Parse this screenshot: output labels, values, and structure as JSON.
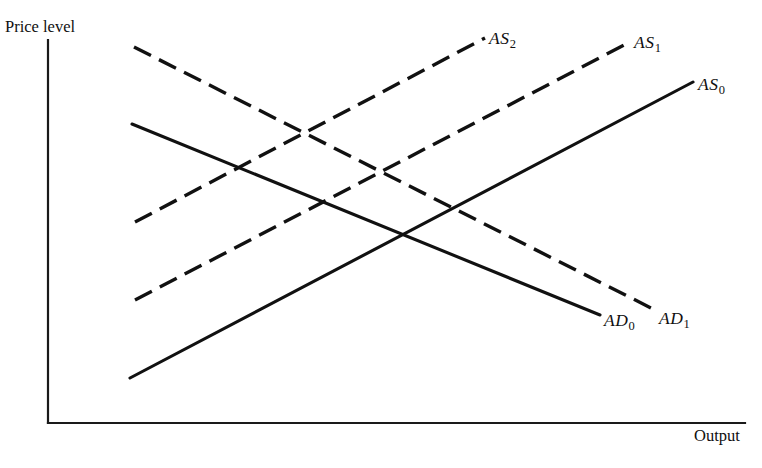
{
  "figure": {
    "type": "economics-as-ad-diagram",
    "background_color": "#ffffff",
    "line_color": "#111111"
  },
  "axes": {
    "y_label": "Price level",
    "x_label": "Output",
    "origin": {
      "x": 48,
      "y": 423
    },
    "y_axis_top": {
      "x": 48,
      "y": 40
    },
    "x_axis_right": {
      "x": 745,
      "y": 423
    }
  },
  "curves": [
    {
      "id": "AS0",
      "name_prefix": "AS",
      "subscript": "0",
      "style": "solid",
      "slope": "upward",
      "start": {
        "x": 130,
        "y": 378
      },
      "end": {
        "x": 693,
        "y": 82
      },
      "label_position": {
        "x": 698,
        "y": 74
      }
    },
    {
      "id": "AS1",
      "name_prefix": "AS",
      "subscript": "1",
      "style": "dashed",
      "slope": "upward",
      "start": {
        "x": 135,
        "y": 300
      },
      "end": {
        "x": 630,
        "y": 42
      },
      "label_position": {
        "x": 634,
        "y": 32
      }
    },
    {
      "id": "AS2",
      "name_prefix": "AS",
      "subscript": "2",
      "style": "dashed",
      "slope": "upward",
      "start": {
        "x": 135,
        "y": 222
      },
      "end": {
        "x": 485,
        "y": 38
      },
      "label_position": {
        "x": 489,
        "y": 28
      }
    },
    {
      "id": "AD0",
      "name_prefix": "AD",
      "subscript": "0",
      "style": "solid",
      "slope": "downward",
      "start": {
        "x": 132,
        "y": 124
      },
      "end": {
        "x": 600,
        "y": 315
      },
      "label_position": {
        "x": 604,
        "y": 310
      }
    },
    {
      "id": "AD1",
      "name_prefix": "AD",
      "subscript": "1",
      "style": "dashed",
      "slope": "downward",
      "start": {
        "x": 134,
        "y": 47
      },
      "end": {
        "x": 655,
        "y": 310
      },
      "label_position": {
        "x": 659,
        "y": 308
      }
    }
  ],
  "chart_data": {
    "type": "line",
    "title": "",
    "xlabel": "Output",
    "ylabel": "Price level",
    "grid": false,
    "legend": "inline-end-of-curve-labels",
    "axis_arrows": false,
    "xlim": [
      48,
      745
    ],
    "ylim": [
      423,
      40
    ],
    "series": [
      {
        "name": "AS0",
        "label": "AS₀",
        "style": "solid",
        "points": [
          [
            130,
            378
          ],
          [
            693,
            82
          ]
        ]
      },
      {
        "name": "AS1",
        "label": "AS₁",
        "style": "dashed",
        "points": [
          [
            135,
            300
          ],
          [
            630,
            42
          ]
        ]
      },
      {
        "name": "AS2",
        "label": "AS₂",
        "style": "dashed",
        "points": [
          [
            135,
            222
          ],
          [
            485,
            38
          ]
        ]
      },
      {
        "name": "AD0",
        "label": "AD₀",
        "style": "solid",
        "points": [
          [
            132,
            124
          ],
          [
            600,
            315
          ]
        ]
      },
      {
        "name": "AD1",
        "label": "AD₁",
        "style": "dashed",
        "points": [
          [
            134,
            47
          ],
          [
            655,
            310
          ]
        ]
      }
    ]
  }
}
